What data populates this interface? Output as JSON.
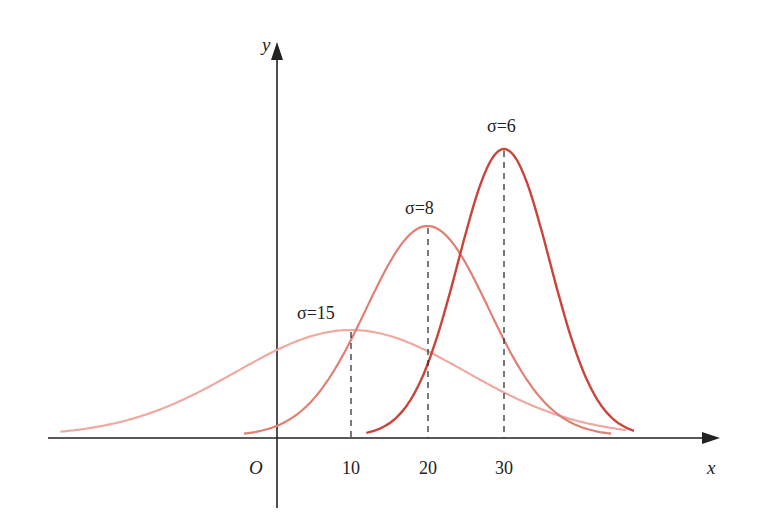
{
  "chart_data": {
    "type": "line",
    "title": "",
    "xlabel": "x",
    "ylabel": "y",
    "origin_label": "O",
    "x_ticks": [
      10,
      20,
      30
    ],
    "x_tick_labels": [
      "10",
      "20",
      "30"
    ],
    "grid": false,
    "legend": "inline annotations",
    "series": [
      {
        "name": "σ=15",
        "label": "σ=15",
        "mean": 10,
        "sigma": 15,
        "color": "#f0a8a0",
        "x_range": [
          -28,
          46
        ]
      },
      {
        "name": "σ=8",
        "label": "σ=8",
        "mean": 20,
        "sigma": 8,
        "color": "#e07f72",
        "x_range": [
          -4,
          44
        ]
      },
      {
        "name": "σ=6",
        "label": "σ=6",
        "mean": 30,
        "sigma": 6,
        "color": "#c8453a",
        "x_range": [
          12,
          47
        ]
      }
    ],
    "annotations": [
      "dashed vertical line at x=10 (mean, σ=15)",
      "dashed vertical line at x=20 (mean, σ=8)",
      "dashed vertical line at x=30 (mean, σ=6)"
    ]
  },
  "labels": {
    "x_axis": "x",
    "y_axis": "y",
    "origin": "O",
    "tick_10": "10",
    "tick_20": "20",
    "tick_30": "30",
    "sigma15": "σ=15",
    "sigma8": "σ=8",
    "sigma6": "σ=6"
  }
}
